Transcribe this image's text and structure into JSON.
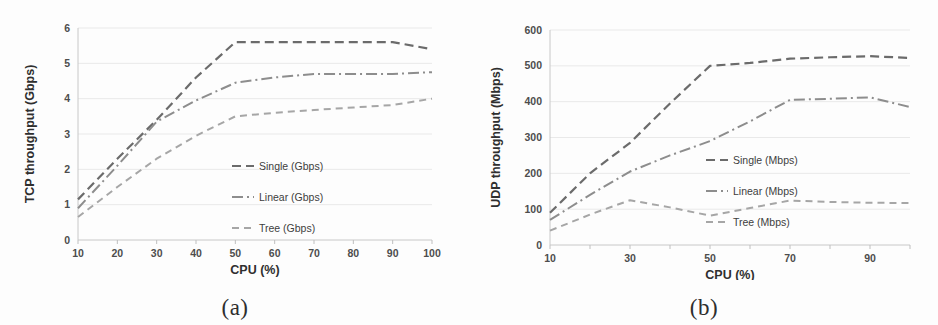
{
  "figure": {
    "panels": [
      {
        "caption": "(a)",
        "chart_data": {
          "type": "line",
          "title": "",
          "xlabel": "CPU (%)",
          "ylabel": "TCP throughput (Gbps)",
          "x": [
            10,
            20,
            30,
            40,
            50,
            60,
            70,
            80,
            90,
            100
          ],
          "xtick_labels": [
            "10",
            "20",
            "30",
            "40",
            "50",
            "60",
            "70",
            "80",
            "90",
            "100"
          ],
          "ytick_labels": [
            "0",
            "1",
            "2",
            "3",
            "4",
            "5",
            "6"
          ],
          "xlim": [
            10,
            100
          ],
          "ylim": [
            0,
            6
          ],
          "grid": true,
          "legend_position": "inside-right",
          "series": [
            {
              "name": "Single (Gbps)",
              "color": "#6b6b6b",
              "dash": "9,5",
              "width": 2.2,
              "values": [
                1.15,
                2.3,
                3.4,
                4.6,
                5.6,
                5.6,
                5.6,
                5.6,
                5.6,
                5.4
              ]
            },
            {
              "name": "Linear (Gbps)",
              "color": "#8d8d8d",
              "dash": "11,4,2,4",
              "width": 2.0,
              "values": [
                0.9,
                2.1,
                3.35,
                3.95,
                4.45,
                4.6,
                4.7,
                4.7,
                4.7,
                4.75
              ]
            },
            {
              "name": "Tree (Gbps)",
              "color": "#a6a6a6",
              "dash": "7,5",
              "width": 2.0,
              "values": [
                0.65,
                1.5,
                2.3,
                2.95,
                3.5,
                3.6,
                3.68,
                3.75,
                3.82,
                4.0
              ]
            }
          ]
        }
      },
      {
        "caption": "(b)",
        "chart_data": {
          "type": "line",
          "title": "",
          "xlabel": "CPU (%)",
          "ylabel": "UDP throughput (Mbps)",
          "x": [
            10,
            20,
            30,
            40,
            50,
            60,
            70,
            80,
            90,
            100
          ],
          "xtick_labels": [
            "10",
            "",
            "30",
            "",
            "50",
            "",
            "70",
            "",
            "90",
            ""
          ],
          "ytick_labels": [
            "0",
            "100",
            "200",
            "300",
            "400",
            "500",
            "600"
          ],
          "xlim": [
            10,
            100
          ],
          "ylim": [
            0,
            600
          ],
          "grid": true,
          "legend_position": "inside-right",
          "series": [
            {
              "name": "Single (Mbps)",
              "color": "#6b6b6b",
              "dash": "9,5",
              "width": 2.2,
              "values": [
                90,
                200,
                285,
                395,
                500,
                508,
                520,
                524,
                527,
                522
              ]
            },
            {
              "name": "Linear (Mbps)",
              "color": "#8d8d8d",
              "dash": "11,4,2,4",
              "width": 2.0,
              "values": [
                70,
                140,
                205,
                250,
                290,
                345,
                405,
                408,
                412,
                385
              ]
            },
            {
              "name": "Tree (Mbps)",
              "color": "#a6a6a6",
              "dash": "7,5",
              "width": 2.0,
              "values": [
                40,
                85,
                125,
                105,
                82,
                103,
                124,
                120,
                118,
                117
              ]
            }
          ]
        }
      }
    ]
  }
}
